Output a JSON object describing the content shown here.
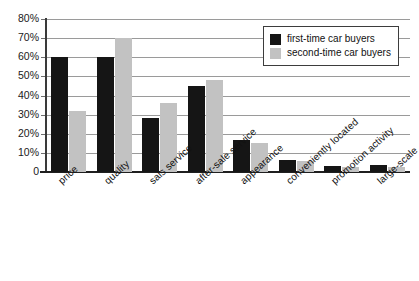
{
  "chart_data": {
    "type": "bar",
    "title": "",
    "subtitle": "",
    "xlabel": "",
    "ylabel": "",
    "ylim": [
      0,
      80
    ],
    "ytick_step": 10,
    "grid": true,
    "legend_position": "top-right",
    "categories": [
      "price",
      "quality",
      "sals service",
      "after-sale service",
      "appearance",
      "conveniently located",
      "promotion activity",
      "large-scale"
    ],
    "ytick_labels": [
      "0",
      "10%",
      "20%",
      "30%",
      "40%",
      "50%",
      "60%",
      "70%",
      "80%"
    ],
    "ytick_values": [
      0,
      10,
      20,
      30,
      40,
      50,
      60,
      70,
      80
    ],
    "series": [
      {
        "name": "first-time car buyers",
        "color": "#151515",
        "values": [
          60,
          60,
          28,
          45,
          17,
          6.5,
          3,
          3.5
        ]
      },
      {
        "name": "second-time car buyers",
        "color": "#c2c2c2",
        "values": [
          32,
          70,
          36,
          48,
          15,
          5.5,
          2.5,
          2.5
        ]
      }
    ]
  }
}
